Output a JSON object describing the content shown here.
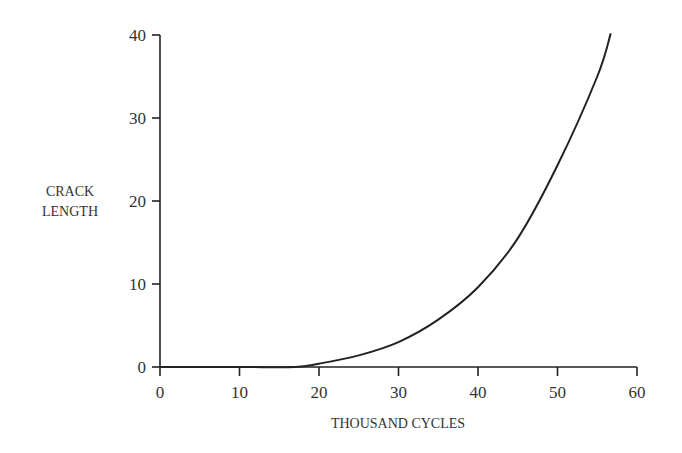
{
  "chart_data": {
    "type": "line",
    "title": "",
    "xlabel": "THOUSAND CYCLES",
    "ylabel": [
      "CRACK",
      "LENGTH"
    ],
    "xlim": [
      0,
      60
    ],
    "ylim": [
      0,
      40
    ],
    "xticks": [
      0,
      10,
      20,
      30,
      40,
      50,
      60
    ],
    "yticks": [
      0,
      10,
      20,
      30,
      40
    ],
    "grid": false,
    "legend": null,
    "series": [
      {
        "name": "crack length",
        "color": "#222222",
        "x": [
          0,
          10,
          17,
          20,
          25,
          30,
          35,
          40,
          45,
          50,
          55,
          56.7
        ],
        "y": [
          0,
          0,
          0,
          0.4,
          1.4,
          3.0,
          5.7,
          9.6,
          15.5,
          24.3,
          35.0,
          40.2
        ]
      }
    ]
  }
}
